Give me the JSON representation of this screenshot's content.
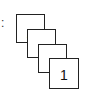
{
  "diagram": {
    "prefix": ":",
    "stack": [
      {
        "label": "4"
      },
      {
        "label": "3"
      },
      {
        "label": "2"
      },
      {
        "label": "1"
      }
    ]
  }
}
